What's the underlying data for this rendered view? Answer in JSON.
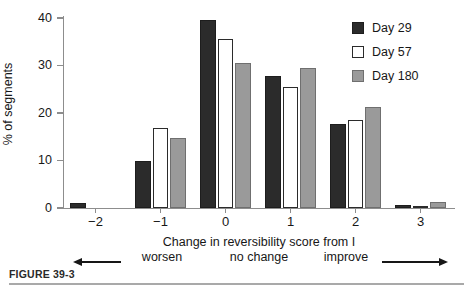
{
  "figure": {
    "caption": "FIGURE 39-3"
  },
  "chart_data": {
    "type": "bar",
    "title": "",
    "xlabel": "Change in reversibility score from I",
    "ylabel": "% of segments",
    "categories": [
      "−2",
      "−1",
      "0",
      "1",
      "2",
      "3"
    ],
    "series": [
      {
        "name": "Day 29",
        "color": "#2b2b2b",
        "values": [
          1.0,
          10.0,
          39.6,
          27.8,
          17.6,
          0.6
        ]
      },
      {
        "name": "Day 57",
        "color": "#ffffff",
        "values": [
          0.0,
          16.9,
          35.6,
          25.5,
          18.5,
          0.3
        ]
      },
      {
        "name": "Day 180",
        "color": "#9a9a9a",
        "values": [
          0.0,
          14.8,
          30.6,
          29.5,
          21.3,
          1.2
        ]
      }
    ],
    "ylim": [
      0,
      40
    ],
    "yticks": [
      0,
      10,
      20,
      30,
      40
    ],
    "ytick_labels": [
      "0",
      "10",
      "20",
      "30",
      "40"
    ],
    "grid": false,
    "legend_position": "top-right"
  },
  "annotations": {
    "worsen": "worsen",
    "no_change": "no change",
    "improve": "improve",
    "left_arrow": "left-arrow-icon",
    "right_arrow": "right-arrow-icon"
  }
}
